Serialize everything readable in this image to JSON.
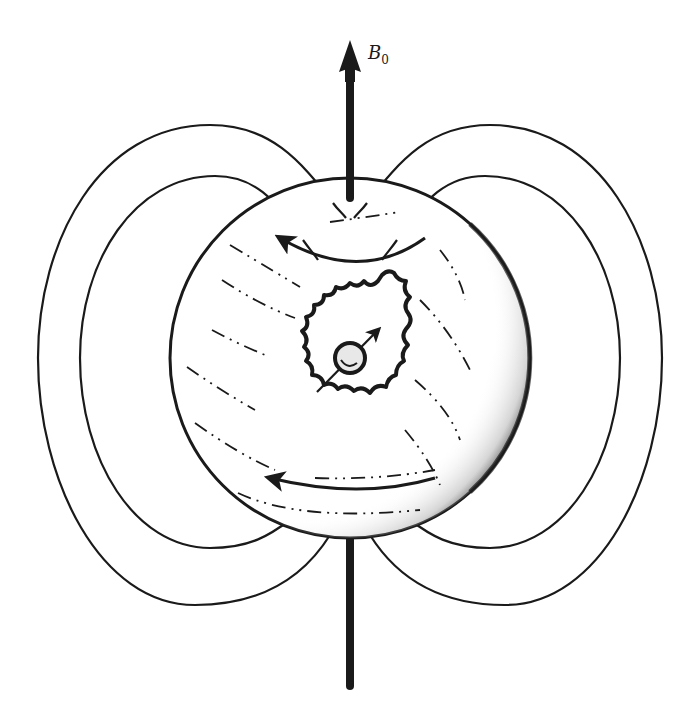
{
  "diagram": {
    "field_label": {
      "symbol": "B",
      "subscript": "0"
    },
    "colors": {
      "ink": "#1a1a1a",
      "background": "#ffffff",
      "shade": "#3a3a3a"
    },
    "elements": [
      {
        "name": "field-axis-arrow",
        "direction": "up",
        "label": "B0"
      },
      {
        "name": "sphere"
      },
      {
        "name": "dipole-field-lines-left",
        "count": 2
      },
      {
        "name": "dipole-field-lines-right",
        "count": 2
      },
      {
        "name": "upper-current-arrow",
        "direction": "counterclockwise"
      },
      {
        "name": "lower-current-arrow",
        "direction": "counterclockwise"
      },
      {
        "name": "electron-cloud"
      },
      {
        "name": "nuclear-spin",
        "arrow_direction": "up-right"
      }
    ]
  }
}
